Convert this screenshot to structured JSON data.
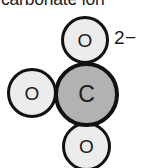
{
  "figure": {
    "caption": "carbonate ion",
    "charge_label": "2−",
    "model_type": "space-filling",
    "colors": {
      "oxygen_fill": "#ececec",
      "carbon_fill": "#b2b2b2",
      "outline": "#111111",
      "text": "#1c1c1c",
      "background": "#ffffff"
    },
    "atoms": [
      {
        "id": "o-top",
        "symbol": "O",
        "element": "oxygen",
        "position": "top"
      },
      {
        "id": "o-left",
        "symbol": "O",
        "element": "oxygen",
        "position": "left"
      },
      {
        "id": "o-bottom",
        "symbol": "O",
        "element": "oxygen",
        "position": "bottom"
      },
      {
        "id": "c-center",
        "symbol": "C",
        "element": "carbon",
        "position": "center"
      }
    ]
  }
}
